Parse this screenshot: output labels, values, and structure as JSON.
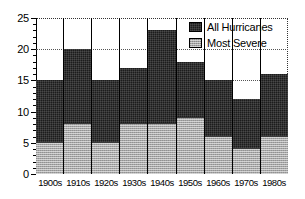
{
  "chart_data": {
    "type": "bar",
    "title": "",
    "subtitle": "",
    "xlabel": "",
    "ylabel": "",
    "categories": [
      "1900s",
      "1910s",
      "1920s",
      "1930s",
      "1940s",
      "1950s",
      "1960s",
      "1970s",
      "1980s"
    ],
    "series": [
      {
        "name": "All Hurricanes",
        "color": "#1c1c1c",
        "values": [
          15,
          20,
          15,
          17,
          23,
          18,
          15,
          12,
          16
        ]
      },
      {
        "name": "Most Severe",
        "color": "#a6a6a6",
        "values": [
          5,
          8,
          5,
          8,
          8,
          9,
          6,
          4,
          6
        ]
      }
    ],
    "ylim": [
      0,
      25
    ],
    "y_ticks": [
      0,
      5,
      10,
      15,
      20,
      25
    ],
    "y_tick_labels": [
      "0",
      "5",
      "10",
      "15",
      "20",
      "25"
    ],
    "y_minor_tick_step": 1,
    "grid": true,
    "grid_style": "dotted",
    "stacked": true,
    "bar_gap": 0,
    "legend_position": "top-right",
    "legend": [
      "All Hurricanes",
      "Most Severe"
    ]
  },
  "legend": {
    "items": [
      {
        "label": "All Hurricanes",
        "swatch": "dark-square-icon"
      },
      {
        "label": "Most Severe",
        "swatch": "gray-hatched-square-icon"
      }
    ]
  }
}
